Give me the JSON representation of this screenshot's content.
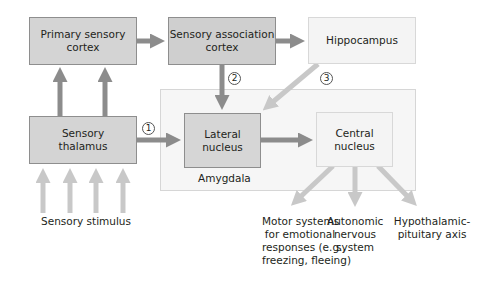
{
  "diagram": {
    "nodes": {
      "primary_cortex": "Primary sensory\ncortex",
      "primary_cortex_l1": "Primary sensory",
      "primary_cortex_l2": "cortex",
      "assoc_cortex_l1": "Sensory association",
      "assoc_cortex_l2": "cortex",
      "hippocampus": "Hippocampus",
      "thalamus_l1": "Sensory",
      "thalamus_l2": "thalamus",
      "lateral_l1": "Lateral",
      "lateral_l2": "nucleus",
      "central_l1": "Central",
      "central_l2": "nucleus",
      "amygdala": "Amygdala"
    },
    "pathways": {
      "p1": "1",
      "p2": "2",
      "p3": "3"
    },
    "inputs": {
      "stimulus": "Sensory stimulus"
    },
    "outputs": {
      "motor_l1": "Motor systems",
      "motor_l2": "for emotional",
      "motor_l3": "responses (e.g.,",
      "motor_l4": "freezing, fleeing)",
      "autonomic_l1": "Autonomic",
      "autonomic_l2": "nervous",
      "autonomic_l3": "system",
      "hpa_l1": "Hypothalamic-",
      "hpa_l2": "pituitary axis"
    },
    "colors": {
      "dark_arrow": "#8c8c8c",
      "light_arrow": "#c8c8c8",
      "dark_box": "#d4d4d4",
      "light_box": "#f4f4f4"
    }
  }
}
